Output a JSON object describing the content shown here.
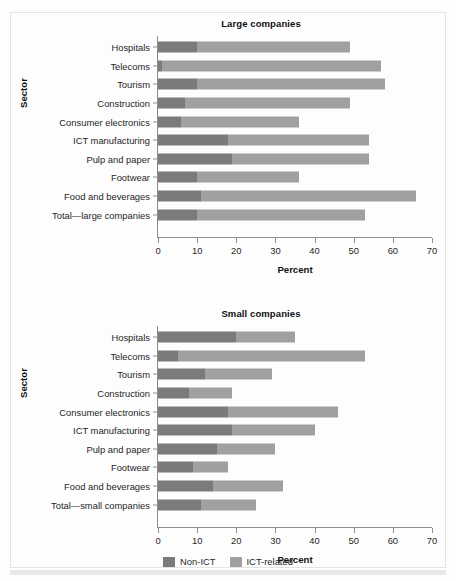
{
  "figure": {
    "axis_title_y": "Sector",
    "axis_title_x": "Percent"
  },
  "legend": {
    "items": [
      {
        "label": "Non-ICT",
        "color": "#7b7b7b",
        "key": "non_ict"
      },
      {
        "label": "ICT-related",
        "color": "#a0a0a0",
        "key": "ict_related"
      }
    ]
  },
  "xaxis": {
    "ticks": [
      "0",
      "10",
      "20",
      "30",
      "40",
      "50",
      "60",
      "70"
    ],
    "min": 0,
    "max": 70,
    "step": 10
  },
  "panels": [
    {
      "id": "large",
      "title": "Large companies"
    },
    {
      "id": "small",
      "title": "Small companies"
    }
  ],
  "chart_data": [
    {
      "type": "bar",
      "orientation": "horizontal",
      "stacked": true,
      "title": "Large companies",
      "xlabel": "Percent",
      "ylabel": "Sector",
      "xlim": [
        0,
        70
      ],
      "grid": false,
      "legend_position": "bottom-center",
      "categories": [
        "Hospitals",
        "Telecoms",
        "Tourism",
        "Construction",
        "Consumer electronics",
        "ICT manufacturing",
        "Pulp and paper",
        "Footwear",
        "Food and beverages",
        "Total—large companies"
      ],
      "series": [
        {
          "name": "Non-ICT",
          "color": "#7b7b7b",
          "values": [
            10,
            1,
            10,
            7,
            6,
            18,
            19,
            10,
            11,
            10
          ]
        },
        {
          "name": "ICT-related",
          "color": "#a0a0a0",
          "values": [
            39,
            56,
            48,
            42,
            30,
            36,
            35,
            26,
            55,
            43
          ]
        }
      ],
      "totals": [
        49,
        57,
        58,
        49,
        36,
        54,
        54,
        36,
        66,
        53
      ]
    },
    {
      "type": "bar",
      "orientation": "horizontal",
      "stacked": true,
      "title": "Small companies",
      "xlabel": "Percent",
      "ylabel": "Sector",
      "xlim": [
        0,
        70
      ],
      "grid": false,
      "legend_position": "bottom-center",
      "categories": [
        "Hospitals",
        "Telecoms",
        "Tourism",
        "Construction",
        "Consumer electronics",
        "ICT manufacturing",
        "Pulp and paper",
        "Footwear",
        "Food and beverages",
        "Total—small companies"
      ],
      "series": [
        {
          "name": "Non-ICT",
          "color": "#7b7b7b",
          "values": [
            20,
            5,
            12,
            8,
            18,
            19,
            15,
            9,
            14,
            11
          ]
        },
        {
          "name": "ICT-related",
          "color": "#a0a0a0",
          "values": [
            15,
            48,
            17,
            11,
            28,
            21,
            15,
            9,
            18,
            14
          ]
        }
      ],
      "totals": [
        35,
        53,
        29,
        19,
        46,
        40,
        30,
        18,
        32,
        25
      ]
    }
  ]
}
